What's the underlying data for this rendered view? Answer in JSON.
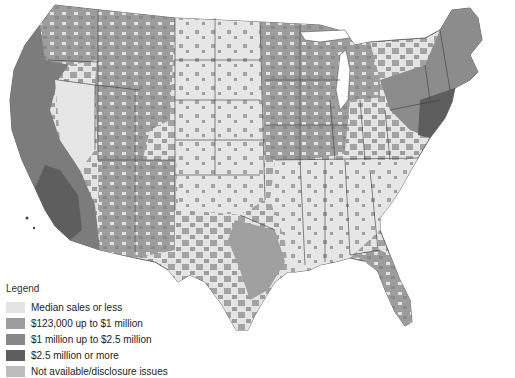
{
  "map": {
    "type": "choropleth",
    "region": "Contiguous United States (counties)",
    "colors": {
      "median_or_less": "#e4e4e4",
      "tier_123k_1m": "#9d9d9d",
      "tier_1m_2_5m": "#878787",
      "tier_2_5m_plus": "#5e5e5e",
      "not_available": "#bdbdbd",
      "state_border": "#3a3a3a",
      "background": "#ffffff"
    }
  },
  "legend": {
    "title": "Legend",
    "items": [
      {
        "label": "Median sales or less",
        "color": "#e4e4e4"
      },
      {
        "label": "$123,000 up to $1 million",
        "color": "#9d9d9d"
      },
      {
        "label": "$1 million up to $2.5 million",
        "color": "#878787"
      },
      {
        "label": "$2.5 million or more",
        "color": "#5e5e5e"
      },
      {
        "label": "Not available/disclosure issues",
        "color": "#bdbdbd"
      }
    ]
  }
}
